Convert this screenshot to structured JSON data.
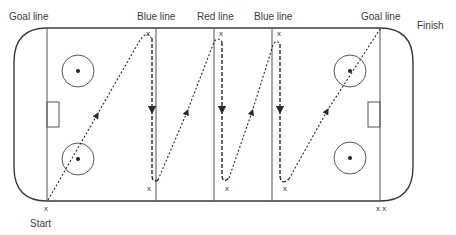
{
  "diagram": {
    "labels": {
      "goal_line_left": "Goal line",
      "blue_line_left": "Blue line",
      "red_line": "Red line",
      "blue_line_right": "Blue line",
      "goal_line_right": "Goal line",
      "start": "Start",
      "finish": "Finish"
    },
    "markers": {
      "symbol": "x",
      "start_corner": "x",
      "blue_left_top": "x",
      "blue_left_bottom": "x",
      "red_top": "x",
      "red_bottom": "x",
      "blue_right_top": "x",
      "blue_right_bottom": "x",
      "finish_corner": "x x"
    },
    "path": {
      "description": "Skater starts at left goal line corner, skates diagonally to top of blue line, down blue line, diagonally to top of red line, down red line, diagonally to top of far blue line, down, then diagonally to far goal line top corner to finish.",
      "style": "dashed with arrows"
    },
    "colors": {
      "line": "#3a3a3a",
      "background": "#ffffff"
    }
  }
}
